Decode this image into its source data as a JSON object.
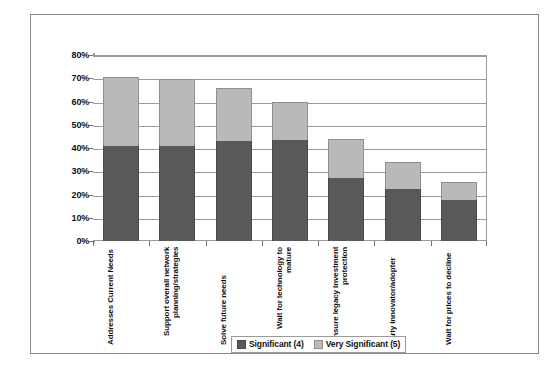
{
  "chart_data": {
    "type": "bar",
    "subtype": "stacked-column",
    "title": "",
    "xlabel": "",
    "ylabel": "",
    "ylim": [
      0,
      80
    ],
    "ytick_labels": [
      "0%",
      "10%",
      "20%",
      "30%",
      "40%",
      "50%",
      "60%",
      "70%",
      "80%"
    ],
    "ytick_values": [
      0,
      10,
      20,
      30,
      40,
      50,
      60,
      70,
      80
    ],
    "grid": true,
    "legend_position": "bottom",
    "categories": [
      "Addresses Current Needs",
      "Support overall network planning/strategies",
      "Solve future needs",
      "Wait for technology to mature",
      "Ensure legacy investment protection",
      "Early innovator/adopter",
      "Wait for prices to decline"
    ],
    "series": [
      {
        "name": "Significant (4)",
        "color": "#595959",
        "values": [
          41,
          41,
          43,
          43.5,
          27,
          22.5,
          17.5
        ]
      },
      {
        "name": "Very Significant (5)",
        "color": "#b9b9b9",
        "values": [
          29.5,
          28.5,
          23,
          16.5,
          17,
          11.5,
          8
        ]
      }
    ],
    "totals": [
      70.5,
      69.5,
      66,
      60,
      44,
      34,
      25.5
    ]
  },
  "legend": {
    "items": [
      {
        "label": "Significant (4)",
        "swatch": "low"
      },
      {
        "label": "Very Significant (5)",
        "swatch": "high"
      }
    ]
  }
}
